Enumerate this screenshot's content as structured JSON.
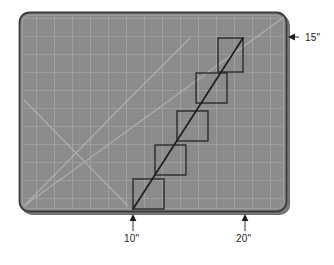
{
  "figure": {
    "background_color": "#ffffff"
  },
  "mat": {
    "name": "self-healing cutting mat",
    "fill_color": "#8a8a8a",
    "border_color": "#3c3c3c",
    "shadow_color": "#6e6e6e",
    "grid_line_color": "#a8a8a8",
    "minor_grid_color": "#949494",
    "diagonal_guide_color": "#b0b0b0",
    "rect": {
      "x": 19,
      "y": 12,
      "width": 268,
      "height": 200,
      "corner_radius": 10
    },
    "major_grid_pitch": 18,
    "minor_grid_pitch": 3.6,
    "guides": [
      "main-diagonal",
      "x-cross-left"
    ]
  },
  "staircase": {
    "name": "staircase step outline",
    "stroke_color": "#2b2b2b",
    "stroke_width": 1.4,
    "step_count": 5,
    "step_width": 31,
    "step_height": 30,
    "rects": [
      {
        "x": 133,
        "y": 179,
        "width": 31,
        "height": 30
      },
      {
        "x": 155,
        "y": 145,
        "width": 31,
        "height": 30
      },
      {
        "x": 177,
        "y": 111,
        "width": 31,
        "height": 30
      },
      {
        "x": 196,
        "y": 73,
        "width": 31,
        "height": 30
      },
      {
        "x": 218,
        "y": 38,
        "width": 25,
        "height": 34
      }
    ],
    "diagonal": {
      "x1": 133,
      "y1": 209,
      "x2": 243,
      "y2": 38
    }
  },
  "annotations": {
    "height_label": {
      "text": "15\"",
      "arrow": "left-arrow",
      "anchor_x": 288,
      "anchor_y": 37
    },
    "start_label": {
      "text": "10\"",
      "arrow": "up-arrow",
      "anchor_x": 133,
      "anchor_y": 212
    },
    "end_label": {
      "text": "20\"",
      "arrow": "up-arrow",
      "anchor_x": 245,
      "anchor_y": 212
    },
    "arrow_color": "#1c1c1c",
    "leader_color": "#4a4a4a"
  },
  "chart_data": {
    "type": "scatter",
    "xlabel": "",
    "ylabel": "",
    "annotations": [
      "15\"",
      "10\"",
      "20\""
    ],
    "series": [
      {
        "name": "staircase-corners",
        "x": [
          10,
          12,
          14,
          16,
          18,
          20
        ],
        "y": [
          0,
          3,
          6,
          9,
          12,
          15
        ]
      }
    ]
  }
}
